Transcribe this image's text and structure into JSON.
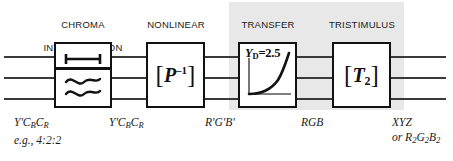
{
  "diagram": {
    "colors": {
      "shade": "#e8e8e8",
      "line": "#3a3a3a",
      "block_border": "#111111",
      "text": "#1a1a1a"
    },
    "stages": [
      {
        "id": "chroma-interpolation",
        "caption_line1": "CHROMA",
        "caption_line2": "INTERPOLATION",
        "block_glyph_top": "i-beam-interval-symbol",
        "block_glyph_bottom": "double-wave-symbol",
        "shaded": false
      },
      {
        "id": "nonlinear-matrix",
        "caption_line1": "NONLINEAR",
        "caption_line2": "3×3",
        "matrix_bracket_open": "[",
        "matrix_symbol": "P",
        "matrix_exponent": "–1",
        "matrix_bracket_close": "]",
        "shaded": false
      },
      {
        "id": "transfer-function",
        "caption_line1": "TRANSFER",
        "caption_line2": "FUNCTION",
        "plot_label_var": "Y",
        "plot_label_sub": "D",
        "plot_label_value": "=2.5",
        "plot_curve": "gamma-power-curve",
        "shaded": true
      },
      {
        "id": "tristimulus-matrix",
        "caption_line1": "TRISTIMULUS",
        "caption_line2": "3×3",
        "matrix_bracket_open": "[",
        "matrix_symbol": "T",
        "matrix_subscript": "2",
        "matrix_bracket_close": "]",
        "shaded": true
      }
    ],
    "signals": [
      {
        "id": "input-ycbcr-subsampled",
        "primary_prefix": "Y'C",
        "primary_sub1": "B",
        "primary_mid": "C",
        "primary_sub2": "R",
        "secondary": "e.g., 4:2:2"
      },
      {
        "id": "ycbcr-interpolated",
        "primary_prefix": "Y'C",
        "primary_sub1": "B",
        "primary_mid": "C",
        "primary_sub2": "R",
        "secondary": ""
      },
      {
        "id": "nonlinear-rgb",
        "primary_prefix": "R'G'B'",
        "secondary": ""
      },
      {
        "id": "linear-rgb",
        "primary_prefix": "RGB",
        "secondary": ""
      },
      {
        "id": "output-tristimulus",
        "primary_prefix": "XYZ",
        "secondary_prefix": "or R",
        "secondary_sub1": "2",
        "secondary_mid1": "G",
        "secondary_sub2": "2",
        "secondary_mid2": "B",
        "secondary_sub3": "2"
      }
    ],
    "wire_count": 3
  }
}
